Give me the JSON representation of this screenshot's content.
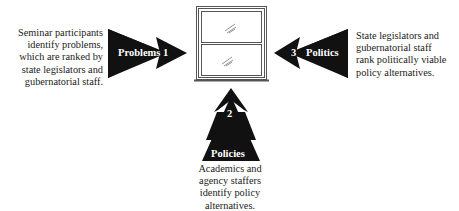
{
  "diagram": {
    "center": {
      "icon": "window-icon"
    },
    "arrows": [
      {
        "id": "problems",
        "label": "Problems",
        "number": "1",
        "direction": "right",
        "description": [
          "Seminar participants",
          "identify problems,",
          "which are ranked by",
          "state legislators and",
          "gubernatorial staff."
        ]
      },
      {
        "id": "policies",
        "label": "Policies",
        "number": "2",
        "direction": "up",
        "description": [
          "Academics and",
          "agency staffers",
          "identify policy",
          "alternatives."
        ]
      },
      {
        "id": "politics",
        "label": "Politics",
        "number": "3",
        "direction": "left",
        "description": [
          "State legislators and",
          "gubernatorial staff",
          "rank politically viable",
          "policy alternatives."
        ]
      }
    ],
    "colors": {
      "arrow": "#111111",
      "window_frame": "#555555",
      "text": "#222222",
      "background": "#ffffff"
    }
  }
}
